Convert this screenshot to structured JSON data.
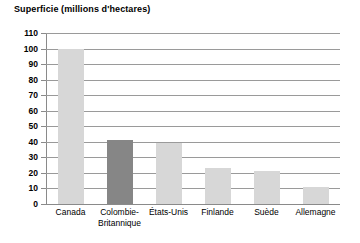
{
  "chart_data": {
    "type": "bar",
    "title": "Superficie (millions d'hectares)",
    "xlabel": "",
    "ylabel": "",
    "ylim": [
      0,
      110
    ],
    "ytick_step": 10,
    "yticks": [
      110,
      100,
      90,
      80,
      70,
      60,
      50,
      40,
      30,
      20,
      10,
      0
    ],
    "grid": true,
    "legend": false,
    "categories": [
      "Canada",
      "Colombie-\nBritannique",
      "États-Unis",
      "Finlande",
      "Suède",
      "Allemagne"
    ],
    "values": [
      100,
      41,
      39,
      23,
      21,
      11
    ],
    "bar_colors": [
      "#d7d7d7",
      "#868686",
      "#d7d7d7",
      "#d7d7d7",
      "#d7d7d7",
      "#d7d7d7"
    ],
    "highlight_category": "Colombie-Britannique",
    "highlight_color": "#868686",
    "base_color": "#d7d7d7",
    "axis_color": "#8a8a8a",
    "gridline_color": "#9a9a9a",
    "text_color": "#000000"
  }
}
